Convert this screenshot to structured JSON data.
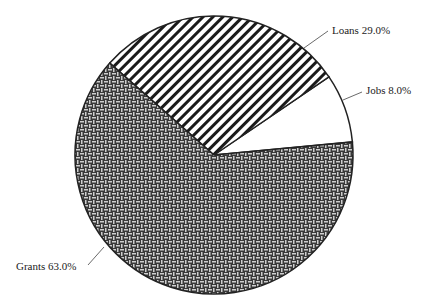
{
  "chart_data": {
    "type": "pie",
    "title": "",
    "categories": [
      "Jobs",
      "Loans",
      "Grants"
    ],
    "values": [
      8.0,
      29.0,
      63.0
    ],
    "unit": "%",
    "labels": [
      "Jobs 8.0%",
      "Loans 29.0%",
      "Grants 63.0%"
    ],
    "patterns": [
      "none",
      "diagonal-stripes",
      "crosshatch-weave"
    ],
    "start_angle_deg": 5.4,
    "direction": "counterclockwise",
    "legend": "none (direct labels with leader lines)"
  },
  "colors": {
    "outline": "#222222",
    "stripe": "#1a1a1a",
    "weave_dark": "#3a3a3a",
    "weave_light": "#bdbdbd",
    "background": "#ffffff"
  }
}
